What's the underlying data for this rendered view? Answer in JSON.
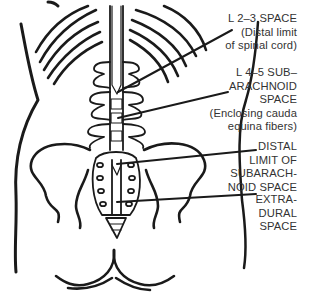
{
  "diagram": {
    "colors": {
      "ink": "#1a1a1a",
      "label_text": "#333333",
      "background": "#ffffff"
    },
    "labels": [
      {
        "id": "l23",
        "text": "L 2–3 SPACE\n(Distal limit\nof spinal cord)"
      },
      {
        "id": "l45",
        "text": "L 4–5 SUB–\nARACHNOID\nSPACE\n(Enclosing cauda\nequina fibers)"
      },
      {
        "id": "distal",
        "text": "DISTAL\nLIMIT OF\nSUBARACH-\nNOID SPACE"
      },
      {
        "id": "extra",
        "text": "EXTRA-\nDURAL\nSPACE"
      }
    ]
  }
}
